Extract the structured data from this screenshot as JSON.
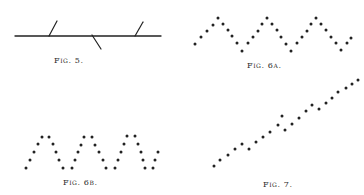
{
  "colors": {
    "ink": "#222222",
    "background": "#ffffff"
  },
  "figures": {
    "fig5": {
      "caption": "Fig. 5.",
      "caption_pos": [
        54,
        56
      ],
      "baseline": {
        "x1": 15,
        "y1": 36,
        "x2": 161,
        "y2": 36
      },
      "ticks": [
        {
          "x1": 49,
          "y1": 36,
          "x2": 57,
          "y2": 21
        },
        {
          "x1": 92,
          "y1": 35,
          "x2": 101,
          "y2": 49
        },
        {
          "x1": 135,
          "y1": 36,
          "x2": 143,
          "y2": 22
        }
      ]
    },
    "fig6a": {
      "caption": "Fig. 6a.",
      "caption_pos": [
        247,
        61
      ],
      "dots": [
        [
          195,
          44
        ],
        [
          201,
          37
        ],
        [
          207,
          31
        ],
        [
          213,
          25
        ],
        [
          218,
          18
        ],
        [
          223,
          24
        ],
        [
          228,
          30
        ],
        [
          232,
          36
        ],
        [
          237,
          43
        ],
        [
          242,
          51
        ],
        [
          248,
          43
        ],
        [
          253,
          37
        ],
        [
          258,
          31
        ],
        [
          262,
          24
        ],
        [
          267,
          18
        ],
        [
          272,
          24
        ],
        [
          277,
          30
        ],
        [
          281,
          37
        ],
        [
          286,
          44
        ],
        [
          291,
          51
        ],
        [
          297,
          43
        ],
        [
          302,
          37
        ],
        [
          307,
          31
        ],
        [
          311,
          24
        ],
        [
          316,
          18
        ],
        [
          321,
          24
        ],
        [
          326,
          30
        ],
        [
          331,
          37
        ],
        [
          336,
          43
        ],
        [
          341,
          50
        ],
        [
          347,
          43
        ],
        [
          351,
          38
        ]
      ]
    },
    "fig6b": {
      "caption": "Fig. 6b.",
      "caption_pos": [
        63,
        178
      ],
      "dots": [
        [
          26,
          168
        ],
        [
          30,
          160
        ],
        [
          34,
          152
        ],
        [
          38,
          144
        ],
        [
          42,
          137
        ],
        [
          49,
          137
        ],
        [
          53,
          144
        ],
        [
          56,
          152
        ],
        [
          59,
          160
        ],
        [
          63,
          168
        ],
        [
          72,
          168
        ],
        [
          75,
          160
        ],
        [
          78,
          152
        ],
        [
          81,
          145
        ],
        [
          84,
          137
        ],
        [
          92,
          137
        ],
        [
          95,
          145
        ],
        [
          99,
          152
        ],
        [
          103,
          160
        ],
        [
          106,
          168
        ],
        [
          115,
          168
        ],
        [
          118,
          160
        ],
        [
          121,
          152
        ],
        [
          124,
          144
        ],
        [
          127,
          136
        ],
        [
          135,
          136
        ],
        [
          138,
          144
        ],
        [
          141,
          152
        ],
        [
          143,
          160
        ],
        [
          145,
          168
        ],
        [
          153,
          168
        ],
        [
          155,
          160
        ],
        [
          158,
          152
        ]
      ]
    },
    "fig7": {
      "caption": "Fig. 7.",
      "caption_pos": [
        263,
        180
      ],
      "dots": [
        [
          214,
          166
        ],
        [
          220,
          160
        ],
        [
          228,
          155
        ],
        [
          235,
          149
        ],
        [
          242,
          144
        ],
        [
          249,
          149
        ],
        [
          256,
          142
        ],
        [
          263,
          137
        ],
        [
          270,
          132
        ],
        [
          278,
          125
        ],
        [
          282,
          116
        ],
        [
          285,
          130
        ],
        [
          292,
          124
        ],
        [
          299,
          118
        ],
        [
          306,
          111
        ],
        [
          312,
          105
        ],
        [
          319,
          109
        ],
        [
          326,
          103
        ],
        [
          332,
          98
        ],
        [
          338,
          92
        ],
        [
          346,
          88
        ],
        [
          352,
          84
        ],
        [
          358,
          80
        ]
      ]
    }
  }
}
